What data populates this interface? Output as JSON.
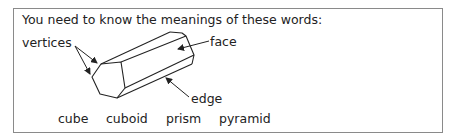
{
  "heading": "You need to know the meanings of these words:",
  "diagram": {
    "labels": {
      "vertices": "vertices",
      "face": "face",
      "edge": "edge"
    },
    "shape": "hexagonal prism"
  },
  "word_list": [
    "cube",
    "cuboid",
    "prism",
    "pyramid"
  ],
  "colors": {
    "border": "#8a8a8a",
    "line": "#222222",
    "text": "#222222"
  }
}
